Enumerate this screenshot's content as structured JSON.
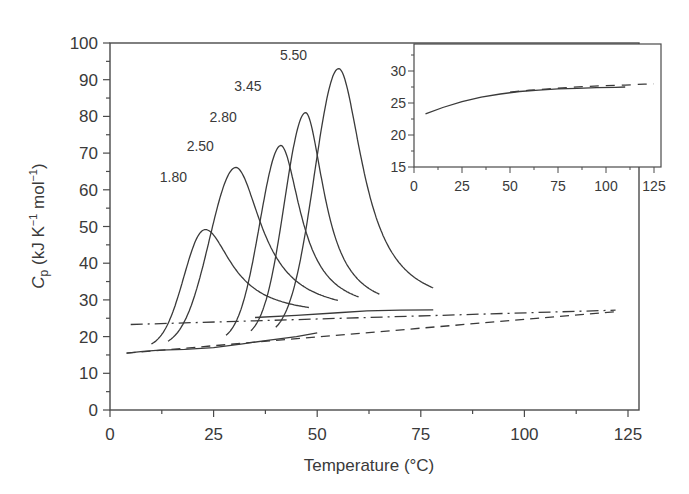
{
  "chart_data": [
    {
      "type": "line",
      "title": "",
      "xlabel": "Temperature (°C)",
      "ylabel": "Cp (kJ K−1 mol−1)",
      "ylabel_parts": {
        "symbol": "C",
        "subscript": "p",
        "units_pre": " (kJ K",
        "sup1": "−1",
        "units_mid": " mol",
        "sup2": "−1",
        "units_post": ")"
      },
      "xlim": [
        0,
        128
      ],
      "ylim": [
        0,
        100
      ],
      "xticks": [
        0,
        25,
        50,
        75,
        100,
        125
      ],
      "yticks": [
        0,
        10,
        20,
        30,
        40,
        50,
        60,
        70,
        80,
        90,
        100
      ],
      "grid": false,
      "legend": "none (series labelled inline above peaks)",
      "series": [
        {
          "name": "1.80",
          "label_pos": [
            12,
            62
          ],
          "peak_x": 22.5,
          "peak_y": 49,
          "start_x": 10,
          "start_y": 18.5,
          "end_x": 48,
          "end_y": 25.5,
          "pre_baseline": 16.5,
          "post_baseline": 25.5
        },
        {
          "name": "2.50",
          "label_pos": [
            18.5,
            70.5
          ],
          "peak_x": 30,
          "peak_y": 66,
          "start_x": 14,
          "start_y": 17.5,
          "end_x": 55,
          "end_y": 26,
          "pre_baseline": 17,
          "post_baseline": 26
        },
        {
          "name": "2.80",
          "label_pos": [
            24,
            78.5
          ],
          "peak_x": 41,
          "peak_y": 72,
          "start_x": 28,
          "start_y": 18.5,
          "end_x": 60,
          "end_y": 26.5,
          "pre_baseline": 18.5,
          "post_baseline": 26.5
        },
        {
          "name": "3.45",
          "label_pos": [
            30,
            87
          ],
          "peak_x": 47,
          "peak_y": 81,
          "start_x": 34,
          "start_y": 19.5,
          "end_x": 65,
          "end_y": 26.5,
          "pre_baseline": 19.5,
          "post_baseline": 26.5
        },
        {
          "name": "5.50",
          "label_pos": [
            41,
            95.5
          ],
          "peak_x": 55,
          "peak_y": 93,
          "start_x": 40,
          "start_y": 20,
          "end_x": 78,
          "end_y": 27.2,
          "pre_baseline": 20,
          "post_baseline": 27.2
        }
      ],
      "reference_lines": [
        {
          "name": "native-baseline",
          "style": "dashed",
          "points": [
            [
              4,
              15.5
            ],
            [
              122,
              26.8
            ]
          ]
        },
        {
          "name": "denatured-baseline",
          "style": "dash-dot",
          "points": [
            [
              5,
              23.3
            ],
            [
              122,
              27.2
            ]
          ]
        }
      ]
    },
    {
      "type": "line",
      "title": "inset",
      "xlabel": "",
      "ylabel": "",
      "xlim": [
        0,
        128
      ],
      "ylim": [
        15,
        34
      ],
      "xticks": [
        0,
        25,
        50,
        75,
        100,
        125
      ],
      "yticks": [
        15,
        20,
        25,
        30
      ],
      "grid": false,
      "series": [
        {
          "name": "solid",
          "style": "solid",
          "x": [
            6,
            15,
            25,
            35,
            45,
            55,
            65,
            75,
            85,
            95,
            105,
            110
          ],
          "y": [
            23.3,
            24.3,
            25.2,
            25.9,
            26.4,
            26.8,
            27.0,
            27.2,
            27.3,
            27.4,
            27.45,
            27.5
          ]
        },
        {
          "name": "dashed",
          "style": "dashed",
          "x": [
            50,
            60,
            70,
            80,
            90,
            100,
            110,
            120,
            125
          ],
          "y": [
            26.7,
            27.0,
            27.2,
            27.4,
            27.6,
            27.7,
            27.8,
            27.95,
            28.0
          ]
        }
      ]
    }
  ],
  "main": {
    "xlabel": "Temperature (°C)",
    "ylabel_symbol": "C",
    "ylabel_sub": "p",
    "ylabel_units_a": " (kJ K",
    "ylabel_sup_a": "−1",
    "ylabel_units_b": " mol",
    "ylabel_sup_b": "−1",
    "ylabel_units_c": ")"
  },
  "colors": {
    "line": "#3a3a3a",
    "axis": "#4a4a4a",
    "background": "#ffffff"
  }
}
